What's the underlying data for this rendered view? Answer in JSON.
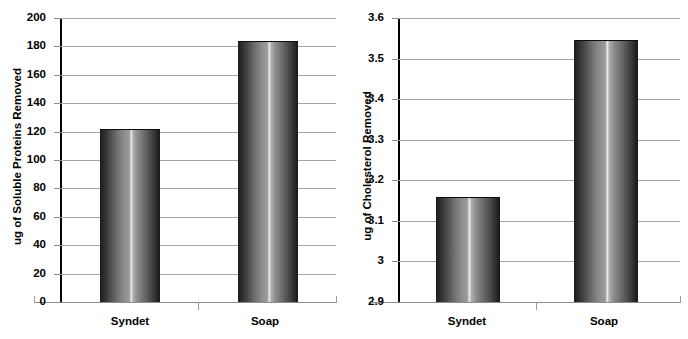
{
  "figure": {
    "background": "#ffffff",
    "gridline_color": "#a6a6a6",
    "axis_color": "#000000",
    "bar_edge_color": "#111111"
  },
  "charts": [
    {
      "id": "soluble-proteins",
      "ylabel": "ug of Soluble Proteins Removed",
      "ytick_labels": [
        "200",
        "180",
        "160",
        "140",
        "120",
        "100",
        "80",
        "60",
        "40",
        "20",
        "0"
      ],
      "xtick_labels": [
        "Syndet",
        "Soap"
      ]
    },
    {
      "id": "cholesterol",
      "ylabel": "ug of Cholesterol Removed",
      "ytick_labels": [
        "3.6",
        "3.5",
        "3.4",
        "3.3",
        "3.2",
        "3.1",
        "3",
        "2.9"
      ],
      "xtick_labels": [
        "Syndet",
        "Soap"
      ]
    }
  ],
  "chart_data": [
    {
      "type": "bar",
      "title": "",
      "xlabel": "",
      "ylabel": "ug of Soluble Proteins Removed",
      "categories": [
        "Syndet",
        "Soap"
      ],
      "values": [
        122,
        184
      ],
      "ylim": [
        0,
        200
      ],
      "ytick_values": [
        0,
        20,
        40,
        60,
        80,
        100,
        120,
        140,
        160,
        180,
        200
      ],
      "ytick_labels": [
        "0",
        "20",
        "40",
        "60",
        "80",
        "100",
        "120",
        "140",
        "160",
        "180",
        "200"
      ],
      "grid": true,
      "legend": false,
      "legend_position": "none",
      "bar_style": "cylinder-gradient-grayscale"
    },
    {
      "type": "bar",
      "title": "",
      "xlabel": "",
      "ylabel": "ug of Cholesterol Removed",
      "categories": [
        "Syndet",
        "Soap"
      ],
      "values": [
        3.16,
        3.545
      ],
      "ylim": [
        2.9,
        3.6
      ],
      "ytick_values": [
        2.9,
        3.0,
        3.1,
        3.2,
        3.3,
        3.4,
        3.5,
        3.6
      ],
      "ytick_labels": [
        "2.9",
        "3",
        "3.1",
        "3.2",
        "3.3",
        "3.4",
        "3.5",
        "3.6"
      ],
      "grid": true,
      "legend": false,
      "legend_position": "none",
      "bar_style": "cylinder-gradient-grayscale"
    }
  ]
}
